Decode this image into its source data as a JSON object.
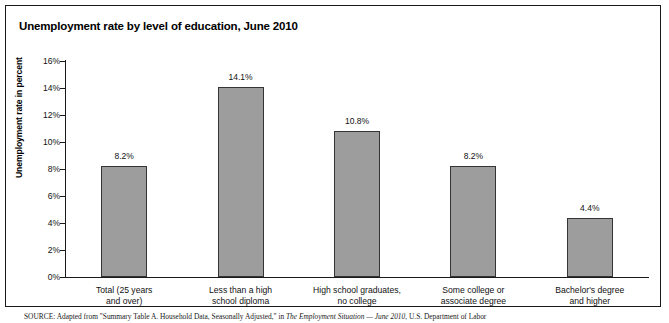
{
  "figure": {
    "title": "Unemployment rate by level of education, June 2010",
    "source_lead": "SOURCE:",
    "source_text_1": " Adapted from \"Summary Table A. Household Data, Seasonally Adjusted,\" in ",
    "source_italic": "The Employment Situation — June 2010",
    "source_text_2": ", U.S. Department of Labor"
  },
  "chart_data": {
    "type": "bar",
    "title": "Unemployment rate by level of education, June 2010",
    "xlabel": "",
    "ylabel": "Unemployment rate in percent",
    "ylim": [
      0,
      16
    ],
    "ytick_labels": [
      "16%",
      "14%",
      "12%",
      "10%",
      "8%",
      "6%",
      "4%",
      "2%",
      "0%"
    ],
    "ytick_values": [
      16,
      14,
      12,
      10,
      8,
      6,
      4,
      2,
      0
    ],
    "grid": false,
    "legend": false,
    "bar_color": "#9d9d9d",
    "bar_edge_color": "#343434",
    "categories": [
      "Total (25 years and over)",
      "Less than a high school diploma",
      "High school graduates, no college",
      "Some college  or associate degree",
      "Bachelor's degree and higher"
    ],
    "category_lines": [
      [
        "Total (25 years",
        "and over)"
      ],
      [
        "Less than a high",
        "school diploma"
      ],
      [
        "High school graduates,",
        "no college"
      ],
      [
        "Some college  or",
        "associate degree"
      ],
      [
        "Bachelor's degree",
        "and higher"
      ]
    ],
    "values": [
      8.2,
      14.1,
      10.8,
      8.2,
      4.4
    ],
    "data_labels": [
      "8.2%",
      "14.1%",
      "10.8%",
      "8.2%",
      "4.4%"
    ]
  }
}
